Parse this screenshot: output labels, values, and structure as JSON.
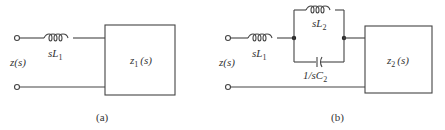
{
  "diagram": {
    "a": {
      "caption": "(a)",
      "input_label": "z(s)",
      "series_inductor": {
        "label_main": "sL",
        "label_sub": "1"
      },
      "load_box": {
        "label_main": "z",
        "label_sub": "1",
        "label_arg": "(s)"
      }
    },
    "b": {
      "caption": "(b)",
      "input_label": "z(s)",
      "series_inductor": {
        "label_main": "sL",
        "label_sub": "1"
      },
      "parallel_inductor": {
        "label_main": "sL",
        "label_sub": "2"
      },
      "parallel_capacitor": {
        "label_main": "1/sC",
        "label_sub": "2"
      },
      "load_box": {
        "label_main": "z",
        "label_sub": "2",
        "label_arg": "(s)"
      }
    }
  },
  "colors": {
    "line": "#444444",
    "text": "#333333",
    "background": "#ffffff"
  }
}
